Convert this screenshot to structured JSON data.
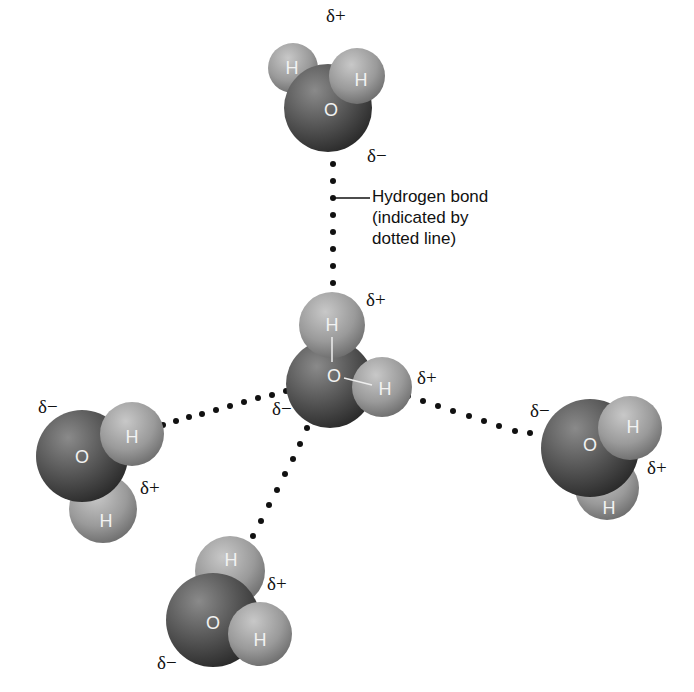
{
  "diagram": {
    "callout": {
      "line1": "Hydrogen bond",
      "line2": "(indicated by",
      "line3": "dotted line)"
    },
    "atom_labels": {
      "hydrogen": "H",
      "oxygen": "O"
    },
    "charges": {
      "partial_positive": "δ+",
      "partial_negative": "δ−"
    },
    "molecules": [
      {
        "name": "top",
        "charges": [
          "δ+",
          "δ−"
        ]
      },
      {
        "name": "center",
        "charges": [
          "δ+",
          "δ+",
          "δ−"
        ]
      },
      {
        "name": "left",
        "charges": [
          "δ−",
          "δ+"
        ]
      },
      {
        "name": "right",
        "charges": [
          "δ−",
          "δ+"
        ]
      },
      {
        "name": "bottom",
        "charges": [
          "δ+",
          "δ−"
        ]
      }
    ],
    "colors": {
      "oxygen": "#5a5a5a",
      "hydrogen": "#9a9a9a",
      "bond_dots": "#111111",
      "background": "#ffffff"
    }
  }
}
